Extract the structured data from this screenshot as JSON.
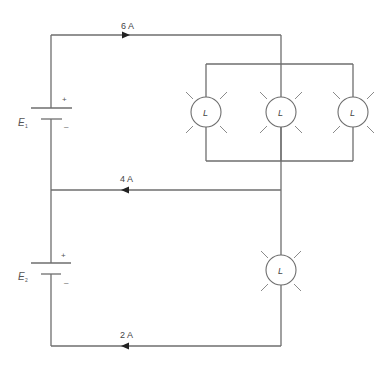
{
  "diagram": {
    "type": "electrical-circuit",
    "sources": [
      {
        "id": "E1",
        "label": "E",
        "subscript": "1",
        "plus": "+",
        "minus": "–"
      },
      {
        "id": "E2",
        "label": "E",
        "subscript": "2",
        "plus": "+",
        "minus": "–"
      }
    ],
    "currents": [
      {
        "label": "6 A",
        "wire": "top",
        "direction": "right"
      },
      {
        "label": "4 A",
        "wire": "middle",
        "direction": "left"
      },
      {
        "label": "2 A",
        "wire": "bottom",
        "direction": "left"
      }
    ],
    "lamps": [
      {
        "label": "L",
        "group": "parallel-upper",
        "position": "left"
      },
      {
        "label": "L",
        "group": "parallel-upper",
        "position": "center"
      },
      {
        "label": "L",
        "group": "parallel-upper",
        "position": "right"
      },
      {
        "label": "L",
        "group": "lower-branch",
        "position": "single"
      }
    ],
    "colors": {
      "wire": "#6e6e6e",
      "arrow": "#222222",
      "text": "#444444"
    }
  }
}
